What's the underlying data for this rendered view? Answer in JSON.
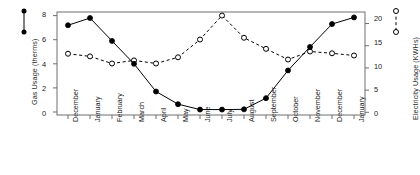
{
  "chart_data": {
    "type": "line",
    "title": "",
    "xlabel": "",
    "categories": [
      "December",
      "January",
      "February",
      "March",
      "April",
      "May",
      "June",
      "July",
      "August",
      "September",
      "October",
      "November",
      "December",
      "January"
    ],
    "series": [
      {
        "name": "Gas Usage",
        "axis": "left",
        "marker": "filled-circle",
        "line_style": "solid",
        "color": "#000000",
        "values": [
          7.2,
          7.8,
          5.9,
          4.0,
          1.7,
          0.65,
          0.2,
          0.2,
          0.22,
          1.15,
          3.45,
          5.4,
          7.3,
          7.85
        ]
      },
      {
        "name": "Electricity Usage",
        "axis": "right",
        "marker": "open-circle",
        "line_style": "dashed",
        "color": "#000000",
        "values": [
          13.2,
          12.6,
          11.0,
          11.7,
          11.0,
          12.4,
          16.4,
          21.8,
          16.8,
          14.3,
          11.9,
          13.7,
          13.3,
          12.8
        ]
      }
    ],
    "left_axis": {
      "label": "Gas Usage (therms)",
      "ticks": [
        "0",
        "2",
        "4",
        "6",
        "8"
      ],
      "tick_values": [
        0,
        2,
        4,
        6,
        8
      ],
      "range": [
        -0.25,
        8.3
      ]
    },
    "right_axis": {
      "label": "Electricity Usage (KWHs)",
      "ticks": [
        "0",
        "5",
        "10",
        "15",
        "20"
      ],
      "tick_values": [
        0,
        5,
        10,
        15,
        20
      ],
      "range": [
        -0.6,
        22.6
      ]
    },
    "grid": false,
    "legend_position": "outside-left-and-right-top",
    "legend": [
      {
        "name": "Gas Usage",
        "marker": "filled-circle",
        "line_style": "solid"
      },
      {
        "name": "Electricity Usage",
        "marker": "open-circle",
        "line_style": "dashed"
      }
    ]
  },
  "axes": {
    "left_title": "Gas Usage (therms)",
    "right_title": "Electricity Usage (KWHs)",
    "left_ticks": [
      "8",
      "6",
      "4",
      "2",
      "0"
    ],
    "right_ticks": [
      "20",
      "15",
      "10",
      "5",
      "0"
    ]
  },
  "xlabels": [
    "December",
    "January",
    "February",
    "March",
    "April",
    "May",
    "June",
    "July",
    "August",
    "September",
    "October",
    "November",
    "December",
    "January"
  ]
}
